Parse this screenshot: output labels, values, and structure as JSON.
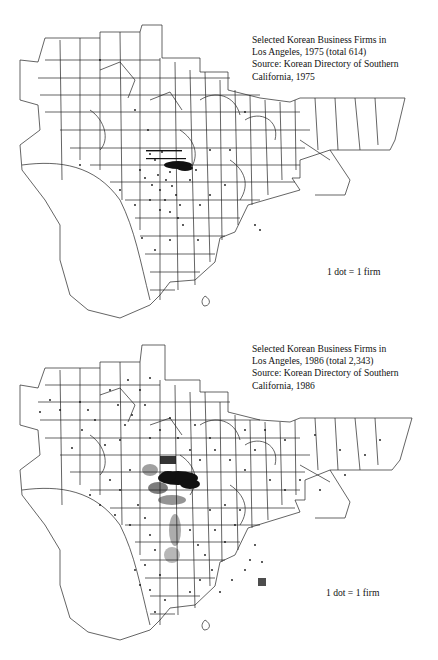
{
  "maps": [
    {
      "caption": {
        "line1": "Selected Korean Business Firms in",
        "line2": "Los Angeles, 1975 (total 614)",
        "line3": "Source: Korean Directory of Southern",
        "line4": "California, 1975"
      },
      "year": "1975",
      "total": "614",
      "legend": "1 dot = 1 firm",
      "dot_density": "low",
      "cluster": "Koreatown / central Los Angeles (dense cluster)"
    },
    {
      "caption": {
        "line1": "Selected Korean Business Firms in",
        "line2": "Los Angeles, 1986 (total 2,343)",
        "line3": "Source: Korean Directory of Southern",
        "line4": "California, 1986"
      },
      "year": "1986",
      "total": "2,343",
      "legend": "1 dot = 1 firm",
      "dot_density": "high",
      "cluster": "Koreatown / central Los Angeles (dense cluster), dispersed across county"
    }
  ],
  "colors": {
    "ink": "#111111",
    "background": "#ffffff"
  }
}
